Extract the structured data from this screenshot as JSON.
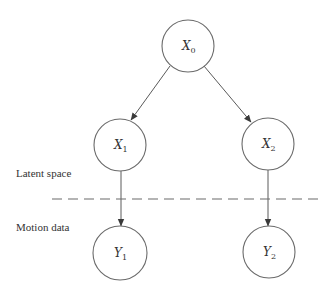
{
  "diagram": {
    "type": "graphical-model",
    "colors": {
      "stroke": "#6a6a6a",
      "text": "#333333",
      "background": "#ffffff"
    },
    "nodes": [
      {
        "id": "X0",
        "main": "X",
        "sub": "0",
        "cx": 188,
        "cy": 46,
        "r": 26
      },
      {
        "id": "X1",
        "main": "X",
        "sub": "1",
        "cx": 120,
        "cy": 145,
        "r": 26
      },
      {
        "id": "X2",
        "main": "X",
        "sub": "2",
        "cx": 268,
        "cy": 144,
        "r": 26
      },
      {
        "id": "Y1",
        "main": "Y",
        "sub": "1",
        "cx": 120,
        "cy": 253,
        "r": 27
      },
      {
        "id": "Y2",
        "main": "Y",
        "sub": "2",
        "cx": 269,
        "cy": 252,
        "r": 26
      }
    ],
    "edges": [
      {
        "from": "X0",
        "to": "X1"
      },
      {
        "from": "X0",
        "to": "X2"
      },
      {
        "from": "X1",
        "to": "Y1"
      },
      {
        "from": "X2",
        "to": "Y2"
      }
    ],
    "regions": {
      "upper_label": "Latent space",
      "lower_label": "Motion data"
    }
  }
}
